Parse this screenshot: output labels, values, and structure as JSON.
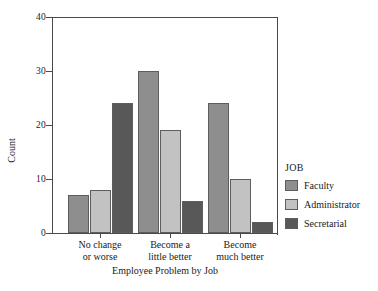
{
  "chart_data": {
    "type": "bar",
    "title": "",
    "xlabel": "Employee Problem by Job",
    "ylabel": "Count",
    "ylim": [
      0,
      40
    ],
    "yticks": [
      0,
      10,
      20,
      30,
      40
    ],
    "grid": false,
    "legend_position": "right",
    "legend_title": "JOB",
    "categories": [
      "No change or worse",
      "Become a little better",
      "Become much better"
    ],
    "category_lines": [
      [
        "No change",
        "or worse"
      ],
      [
        "Become a",
        "little better"
      ],
      [
        "Become",
        "much better"
      ]
    ],
    "series": [
      {
        "name": "Faculty",
        "values": [
          7,
          30,
          24
        ],
        "color": "#8e8e8e"
      },
      {
        "name": "Administrator",
        "values": [
          8,
          19,
          10
        ],
        "color": "#c2c2c2"
      },
      {
        "name": "Secretarial",
        "values": [
          24,
          6,
          2
        ],
        "color": "#585858"
      }
    ]
  },
  "axis": {
    "y_tick_labels": [
      "0",
      "10",
      "20",
      "30",
      "40"
    ]
  }
}
